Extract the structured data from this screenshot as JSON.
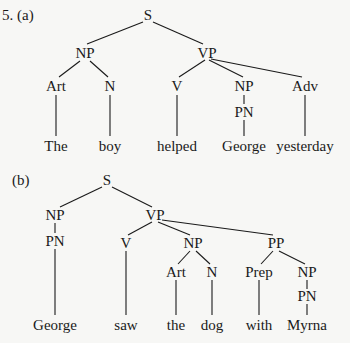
{
  "labels": {
    "a": "5. (a)",
    "b": "(b)"
  },
  "tree_a": {
    "nodes": [
      {
        "id": "S",
        "label": "S",
        "x": 148,
        "y": 15
      },
      {
        "id": "NP1",
        "label": "NP",
        "x": 85,
        "y": 53
      },
      {
        "id": "VP",
        "label": "VP",
        "x": 207,
        "y": 53
      },
      {
        "id": "Art",
        "label": "Art",
        "x": 56,
        "y": 86
      },
      {
        "id": "N",
        "label": "N",
        "x": 110,
        "y": 86
      },
      {
        "id": "V",
        "label": "V",
        "x": 177,
        "y": 86
      },
      {
        "id": "NP2",
        "label": "NP",
        "x": 244,
        "y": 86
      },
      {
        "id": "PN",
        "label": "PN",
        "x": 244,
        "y": 112
      },
      {
        "id": "Adv",
        "label": "Adv",
        "x": 305,
        "y": 86
      },
      {
        "id": "w1",
        "label": "The",
        "x": 56,
        "y": 146
      },
      {
        "id": "w2",
        "label": "boy",
        "x": 110,
        "y": 146
      },
      {
        "id": "w3",
        "label": "helped",
        "x": 177,
        "y": 146
      },
      {
        "id": "w4",
        "label": "George",
        "x": 244,
        "y": 146
      },
      {
        "id": "w5",
        "label": "yesterday",
        "x": 305,
        "y": 146
      }
    ]
  },
  "tree_b": {
    "nodes": [
      {
        "id": "S",
        "label": "S",
        "x": 107,
        "y": 180
      },
      {
        "id": "NP1",
        "label": "NP",
        "x": 55,
        "y": 215
      },
      {
        "id": "VP",
        "label": "VP",
        "x": 155,
        "y": 215
      },
      {
        "id": "PN1",
        "label": "PN",
        "x": 55,
        "y": 241
      },
      {
        "id": "V",
        "label": "V",
        "x": 126,
        "y": 243
      },
      {
        "id": "NP2",
        "label": "NP",
        "x": 193,
        "y": 243
      },
      {
        "id": "PP",
        "label": "PP",
        "x": 276,
        "y": 243
      },
      {
        "id": "Art",
        "label": "Art",
        "x": 176,
        "y": 272
      },
      {
        "id": "N",
        "label": "N",
        "x": 212,
        "y": 272
      },
      {
        "id": "Prep",
        "label": "Prep",
        "x": 259,
        "y": 272
      },
      {
        "id": "NP3",
        "label": "NP",
        "x": 307,
        "y": 272
      },
      {
        "id": "PN2",
        "label": "PN",
        "x": 307,
        "y": 296
      },
      {
        "id": "w1",
        "label": "George",
        "x": 55,
        "y": 325
      },
      {
        "id": "w2",
        "label": "saw",
        "x": 126,
        "y": 325
      },
      {
        "id": "w3",
        "label": "the",
        "x": 176,
        "y": 325
      },
      {
        "id": "w4",
        "label": "dog",
        "x": 212,
        "y": 325
      },
      {
        "id": "w5",
        "label": "with",
        "x": 259,
        "y": 325
      },
      {
        "id": "w6",
        "label": "Myrna",
        "x": 307,
        "y": 325
      }
    ]
  }
}
